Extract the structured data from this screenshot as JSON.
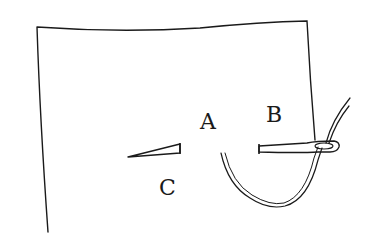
{
  "diagram": {
    "type": "sewing-stitch-illustration",
    "labels": [
      {
        "id": "A",
        "text": "A"
      },
      {
        "id": "B",
        "text": "B"
      },
      {
        "id": "C",
        "text": "C"
      }
    ],
    "elements": {
      "fabric": "fabric-edge-outline",
      "stitch_c": "completed-stitch-c",
      "needle": "needle-at-b",
      "thread": "thread-loop"
    },
    "colors": {
      "stroke": "#1a1a1a",
      "background": "#ffffff"
    }
  }
}
